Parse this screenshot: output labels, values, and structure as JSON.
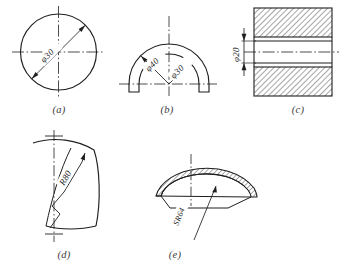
{
  "sheet": {
    "width": 339,
    "height": 278,
    "background": "#ffffff",
    "line_color": "#1f1f1f",
    "hatch_color": "#2a2a2a"
  },
  "panels": [
    {
      "id": "a",
      "caption": "(a)",
      "title": "circle-with-diameter-dimension",
      "description": "Full circle with dash-dot crosshair centerlines and an inclined diameter dimension line arrowed at both ends.",
      "dimensions": [
        {
          "name": "diameter",
          "symbol": "φ",
          "value": "30",
          "label": "φ30",
          "placement": "inclined-inside"
        }
      ]
    },
    {
      "id": "b",
      "caption": "(b)",
      "title": "semicircular-ring-two-diameters",
      "description": "Half annulus (semicircular arc band) with small feet at both ends, horizontal dash-dot centerline and vertical centerline; two inclined diameter dimensions radiating from the centre.",
      "dimensions": [
        {
          "name": "outer-diameter",
          "symbol": "φ",
          "value": "40",
          "label": "φ40",
          "placement": "inclined-left"
        },
        {
          "name": "inner-diameter",
          "symbol": "φ",
          "value": "30",
          "label": "φ30",
          "placement": "inclined-right"
        }
      ]
    },
    {
      "id": "c",
      "caption": "(c)",
      "title": "section-view-bore-diameter",
      "description": "Sectional (cut) view of a bored part: hatched material above and below a central bore, horizontal dash-dot axis, vertical diameter dimension placed outside to the left with arrows pointing outward.",
      "dimensions": [
        {
          "name": "bore-diameter",
          "symbol": "φ",
          "value": "20",
          "label": "φ20",
          "placement": "vertical-outside-left"
        }
      ]
    },
    {
      "id": "d",
      "caption": "(d)",
      "title": "large-radius-broken-leader",
      "description": "Curved plate whose centre of curvature is off the sheet; radius dimension drawn with a broken (zig-zag) leader line aimed at the arc, cross marks on the vertical centre axis.",
      "dimensions": [
        {
          "name": "radius",
          "symbol": "R",
          "value": "80",
          "label": "R80",
          "placement": "along-broken-leader"
        }
      ]
    },
    {
      "id": "e",
      "caption": "(e)",
      "title": "spherical-dome-section-radius",
      "description": "Sectioned thin spherical dome (shallow cap) with narrow hatched wall, vertical centreline and a spherical-radius leader pointing up into the wall.",
      "dimensions": [
        {
          "name": "spherical-radius",
          "symbol": "SR",
          "value": "64",
          "label": "SR64",
          "placement": "along-leader-below"
        }
      ]
    }
  ]
}
